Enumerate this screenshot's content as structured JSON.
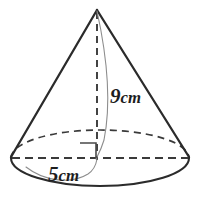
{
  "figure": {
    "name": "cone-with-dimensions",
    "shape": "cone",
    "background_color": "#ffffff",
    "width": 202,
    "height": 209,
    "stroke_color": "#2b2b2b",
    "thin_stroke_color": "#8a8a8a",
    "dash_color": "#3a3a3a",
    "text_color": "#1d1d1d",
    "apex": {
      "x": 97,
      "y": 9
    },
    "base_center": {
      "x": 100,
      "y": 158
    },
    "base_rx": 89,
    "base_ry": 28
  },
  "labels": {
    "height": {
      "value": "9",
      "unit": "cm",
      "text": "9cm",
      "meaning": "perpendicular height of cone",
      "x": 110,
      "y": 102
    },
    "radius": {
      "value": "5",
      "unit": "cm",
      "text": "5cm",
      "meaning": "radius of circular base",
      "x": 48,
      "y": 180
    }
  },
  "annotations": {
    "right_angle_marker": {
      "name": "right-angle-marker",
      "meaning": "height is perpendicular to base",
      "x": 80,
      "y": 143,
      "size": 16
    }
  },
  "parts": [
    {
      "name": "left-slant-edge",
      "style": "solid"
    },
    {
      "name": "right-slant-edge",
      "style": "solid"
    },
    {
      "name": "base-front-arc",
      "style": "solid"
    },
    {
      "name": "base-back-arc",
      "style": "dashed"
    },
    {
      "name": "base-diameter-line",
      "style": "dashed"
    },
    {
      "name": "cone-height-line",
      "style": "dashed"
    },
    {
      "name": "height-leader-curve",
      "style": "thin-solid"
    },
    {
      "name": "radius-leader-curve",
      "style": "thin-solid"
    }
  ]
}
